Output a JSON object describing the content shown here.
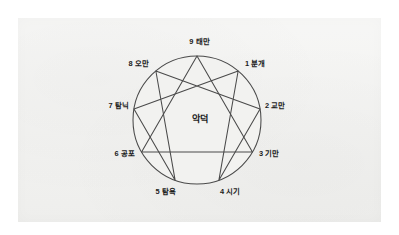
{
  "figure": {
    "center_label": "악덕",
    "panel_color": "#f2f2f0",
    "page_color": "#ffffff",
    "line_color": "#4a4a4a",
    "text_color": "#1b1b1b",
    "circle_fill": "#f2f2f0"
  },
  "chart_data": {
    "type": "diagram",
    "title": "악덕",
    "subtype": "enneagram",
    "center_label": "악덕",
    "xlabel": "",
    "ylabel": "",
    "grid": false,
    "legend": "none",
    "geometry": {
      "center_x": 197,
      "center_y": 120,
      "radius": 64,
      "point_count": 9,
      "top_point": "9",
      "direction": "clockwise"
    },
    "categories": [
      "9",
      "1",
      "2",
      "3",
      "4",
      "5",
      "6",
      "7",
      "8"
    ],
    "points": [
      {
        "number": "9",
        "vice": "태만",
        "label": "9 태만",
        "angle_deg": 90,
        "label_x": 197,
        "label_y": 42,
        "anchor": "center"
      },
      {
        "number": "1",
        "vice": "분개",
        "label": "1 분개",
        "angle_deg": 50,
        "label_x": 245,
        "label_y": 64,
        "anchor": "left"
      },
      {
        "number": "2",
        "vice": "교만",
        "label": "2 교만",
        "angle_deg": 10,
        "label_x": 265,
        "label_y": 106,
        "anchor": "left"
      },
      {
        "number": "3",
        "vice": "기만",
        "label": "3 기만",
        "angle_deg": -30,
        "label_x": 259,
        "label_y": 154,
        "anchor": "left"
      },
      {
        "number": "4",
        "vice": "시기",
        "label": "4 시기",
        "angle_deg": -70,
        "label_x": 220,
        "label_y": 192,
        "anchor": "left"
      },
      {
        "number": "5",
        "vice": "탐욕",
        "label": "5 탐욕",
        "angle_deg": -110,
        "label_x": 176,
        "label_y": 192,
        "anchor": "right"
      },
      {
        "number": "6",
        "vice": "공포",
        "label": "6 공포",
        "angle_deg": -150,
        "label_x": 135,
        "label_y": 154,
        "anchor": "right"
      },
      {
        "number": "7",
        "vice": "탐닉",
        "label": "7 탐닉",
        "angle_deg": 170,
        "label_x": 129,
        "label_y": 106,
        "anchor": "right"
      },
      {
        "number": "8",
        "vice": "오만",
        "label": "8 오만",
        "angle_deg": 130,
        "label_x": 149,
        "label_y": 64,
        "anchor": "right"
      }
    ],
    "inner_triangle": [
      "9",
      "3",
      "6"
    ],
    "inner_hexad": [
      "1",
      "4",
      "2",
      "8",
      "5",
      "7"
    ],
    "values": [
      1,
      1,
      1,
      1,
      1,
      1,
      1,
      1,
      1
    ]
  }
}
